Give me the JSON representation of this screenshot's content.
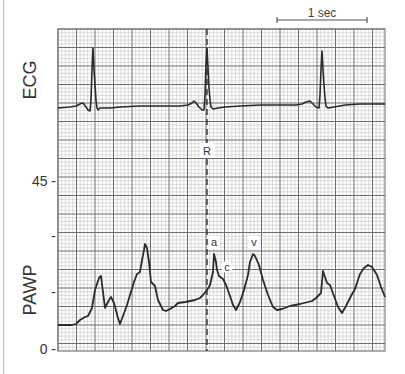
{
  "chart_data": {
    "type": "line",
    "title": "",
    "panels": [
      {
        "name": "ECG",
        "ylabel": "ECG",
        "series": [
          {
            "name": "ECG",
            "points": [
              [
                58,
                108
              ],
              [
                70,
                107
              ],
              [
                76,
                106
              ],
              [
                80,
                104
              ],
              [
                82,
                103
              ],
              [
                84,
                104
              ],
              [
                86,
                107
              ],
              [
                88,
                110
              ],
              [
                90,
                111
              ],
              [
                91,
                100
              ],
              [
                92,
                70
              ],
              [
                93,
                48
              ],
              [
                94,
                70
              ],
              [
                95,
                84
              ],
              [
                96,
                100
              ],
              [
                97,
                108
              ],
              [
                98,
                110
              ],
              [
                100,
                108
              ],
              [
                110,
                108
              ],
              [
                120,
                107
              ],
              [
                140,
                106
              ],
              [
                160,
                106
              ],
              [
                180,
                106
              ],
              [
                188,
                105
              ],
              [
                192,
                103
              ],
              [
                194,
                101
              ],
              [
                196,
                103
              ],
              [
                199,
                107
              ],
              [
                202,
                110
              ],
              [
                204,
                110
              ],
              [
                205,
                95
              ],
              [
                206,
                65
              ],
              [
                207,
                48
              ],
              [
                208,
                68
              ],
              [
                209,
                88
              ],
              [
                210,
                100
              ],
              [
                211,
                107
              ],
              [
                213,
                109
              ],
              [
                218,
                108
              ],
              [
                225,
                107
              ],
              [
                240,
                106
              ],
              [
                260,
                105
              ],
              [
                280,
                105
              ],
              [
                296,
                105
              ],
              [
                302,
                104
              ],
              [
                306,
                102
              ],
              [
                310,
                101
              ],
              [
                313,
                104
              ],
              [
                316,
                107
              ],
              [
                319,
                108
              ],
              [
                320,
                95
              ],
              [
                321,
                70
              ],
              [
                322,
                51
              ],
              [
                323,
                70
              ],
              [
                324,
                85
              ],
              [
                325,
                98
              ],
              [
                326,
                106
              ],
              [
                328,
                108
              ],
              [
                334,
                107
              ],
              [
                345,
                105
              ],
              [
                360,
                104
              ],
              [
                375,
                104
              ],
              [
                385,
                104
              ]
            ]
          }
        ]
      },
      {
        "name": "PAWP",
        "ylabel": "PAWP",
        "yticks": [
          {
            "label": "45 -",
            "value": 45
          },
          {
            "label": "-",
            "value": 30
          },
          {
            "label": "-",
            "value": 15
          },
          {
            "label": "0 -",
            "value": 0
          }
        ],
        "ylim": [
          0,
          45
        ],
        "series": [
          {
            "name": "PAWP",
            "points": [
              [
                58,
                325
              ],
              [
                72,
                325
              ],
              [
                76,
                324
              ],
              [
                80,
                320
              ],
              [
                85,
                317
              ],
              [
                88,
                316
              ],
              [
                92,
                308
              ],
              [
                95,
                290
              ],
              [
                99,
                278
              ],
              [
                101,
                276
              ],
              [
                103,
                292
              ],
              [
                105,
                308
              ],
              [
                109,
                300
              ],
              [
                111,
                297
              ],
              [
                114,
                303
              ],
              [
                118,
                318
              ],
              [
                120,
                324
              ],
              [
                123,
                316
              ],
              [
                127,
                305
              ],
              [
                130,
                295
              ],
              [
                134,
                282
              ],
              [
                137,
                274
              ],
              [
                140,
                272
              ],
              [
                142,
                260
              ],
              [
                144,
                250
              ],
              [
                145,
                244
              ],
              [
                147,
                248
              ],
              [
                149,
                262
              ],
              [
                151,
                282
              ],
              [
                155,
                286
              ],
              [
                158,
                300
              ],
              [
                163,
                310
              ],
              [
                166,
                311
              ],
              [
                170,
                309
              ],
              [
                175,
                306
              ],
              [
                178,
                303
              ],
              [
                185,
                302
              ],
              [
                195,
                300
              ],
              [
                200,
                298
              ],
              [
                203,
                295
              ],
              [
                207,
                290
              ],
              [
                210,
                285
              ],
              [
                213,
                272
              ],
              [
                214,
                254
              ],
              [
                216,
                262
              ],
              [
                217,
                270
              ],
              [
                219,
                276
              ],
              [
                223,
                279
              ],
              [
                226,
                285
              ],
              [
                230,
                296
              ],
              [
                233,
                305
              ],
              [
                236,
                310
              ],
              [
                240,
                302
              ],
              [
                244,
                290
              ],
              [
                248,
                275
              ],
              [
                250,
                262
              ],
              [
                253,
                254
              ],
              [
                255,
                256
              ],
              [
                259,
                265
              ],
              [
                263,
                280
              ],
              [
                268,
                295
              ],
              [
                273,
                307
              ],
              [
                277,
                310
              ],
              [
                282,
                309
              ],
              [
                290,
                306
              ],
              [
                300,
                304
              ],
              [
                312,
                301
              ],
              [
                316,
                298
              ],
              [
                318,
                296
              ],
              [
                321,
                293
              ],
              [
                323,
                271
              ],
              [
                325,
                277
              ],
              [
                327,
                283
              ],
              [
                330,
                285
              ],
              [
                334,
                296
              ],
              [
                338,
                307
              ],
              [
                342,
                313
              ],
              [
                346,
                306
              ],
              [
                351,
                296
              ],
              [
                355,
                289
              ],
              [
                360,
                274
              ],
              [
                364,
                268
              ],
              [
                368,
                265
              ],
              [
                372,
                267
              ],
              [
                377,
                275
              ],
              [
                381,
                287
              ],
              [
                385,
                297
              ]
            ]
          }
        ],
        "annotations": [
          {
            "label": "a",
            "x": 214,
            "y": 243
          },
          {
            "label": "c",
            "x": 227,
            "y": 267
          },
          {
            "label": "v",
            "x": 254,
            "y": 243
          }
        ]
      }
    ],
    "markers": {
      "r_line_label": "R",
      "scale_bar_label": "1 sec"
    },
    "grid": true,
    "grid_major_px": 18.5,
    "grid_minor_per_major": 5
  },
  "labels": {
    "ecg": "ECG",
    "pawp": "PAWP",
    "scale": "1 sec",
    "r": "R",
    "a": "a",
    "c": "c",
    "v": "v",
    "tick_45": "45 -",
    "tick_30": "-",
    "tick_15": "-",
    "tick_0": "0 -"
  },
  "colors": {
    "trace": "#2a2a2a",
    "grid_major": "#6e6e6e",
    "grid_minor": "#c4c4c4",
    "text": "#333333"
  }
}
